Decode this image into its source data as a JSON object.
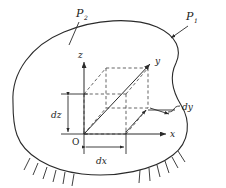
{
  "figure": {
    "type": "engineering-diagram",
    "background": "#ffffff",
    "stroke_color": "#2a2a2a",
    "dashed_color": "#4a4a4a"
  },
  "labels": {
    "surface_p2": "P",
    "surface_p2_sub": "2",
    "surface_p1": "P",
    "surface_p1_sub": "1",
    "axis_x": "x",
    "axis_y": "y",
    "axis_z": "z",
    "origin": "O",
    "dim_dx": "dx",
    "dim_dy": "dy",
    "dim_dz": "dz"
  },
  "annotations": {
    "p2_leader": "leader line from P2 label to upper-left boundary",
    "p1_leader": "arrow from P1 label to upper-right boundary",
    "support_left": "hatched fixed support on lower-left boundary",
    "support_right": "hatched fixed support on lower-right boundary",
    "volume_element": "dashed cube of size dx by dy by dz at origin O"
  },
  "geometry": {
    "body_outline": "M 12,104 C 10,70 34,44 66,32 C 98,20 134,18 158,27 C 176,34 182,48 176,62 C 170,76 172,92 180,104 C 190,119 192,140 176,154 C 158,170 118,178 84,174 C 50,170 24,156 16,136 C 12,126 12,114 12,104 Z",
    "origin_px": [
      84,
      134
    ],
    "x_axis_end": [
      165,
      134
    ],
    "y_axis_end": [
      148,
      68
    ],
    "z_axis_end": [
      84,
      62
    ],
    "cube_dx": 42,
    "cube_dz": 40
  }
}
